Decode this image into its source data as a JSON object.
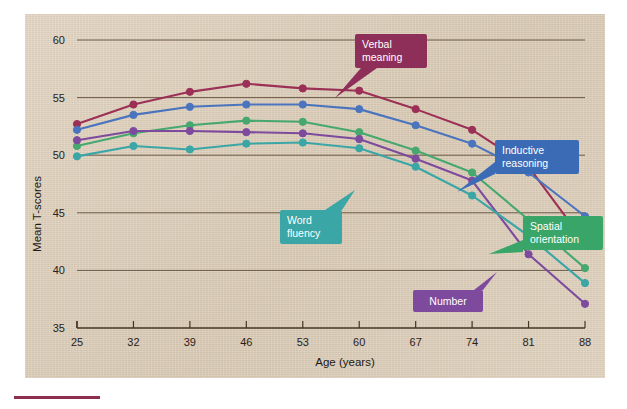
{
  "figure": {
    "background_color": "#ded0bd",
    "accent_rule_color": "#8e2f4f"
  },
  "axes": {
    "x_title": "Age (years)",
    "y_title": "Mean T-scores",
    "x_ticks": [
      "25",
      "32",
      "39",
      "46",
      "53",
      "60",
      "67",
      "74",
      "81",
      "88"
    ],
    "y_ticks": [
      "35",
      "40",
      "45",
      "50",
      "55",
      "60"
    ]
  },
  "callouts": [
    {
      "id": "verbal-meaning",
      "label": "Verbal meaning",
      "line1": "Verbal",
      "line2": "meaning",
      "color": "#8e2f5a"
    },
    {
      "id": "inductive-reasoning",
      "label": "Inductive reasoning",
      "line1": "Inductive",
      "line2": "reasoning",
      "color": "#3b6bb5"
    },
    {
      "id": "word-fluency",
      "label": "Word fluency",
      "line1": "Word",
      "line2": "fluency",
      "color": "#3aa6a6"
    },
    {
      "id": "spatial-orientation",
      "label": "Spatial orientation",
      "line1": "Spatial",
      "line2": "orientation",
      "color": "#3aa568"
    },
    {
      "id": "number",
      "label": "Number",
      "line1": "Number",
      "line2": "",
      "color": "#7d4a9e"
    }
  ],
  "chart_data": {
    "type": "line",
    "title": "",
    "xlabel": "Age (years)",
    "ylabel": "Mean T-scores",
    "x": [
      25,
      32,
      39,
      46,
      53,
      60,
      67,
      74,
      81,
      88
    ],
    "xlim": [
      25,
      88
    ],
    "ylim": [
      35,
      60
    ],
    "grid": true,
    "legend_position": "inline-callouts",
    "series": [
      {
        "name": "Verbal meaning",
        "color": "#9b2f55",
        "values": [
          52.7,
          54.4,
          55.5,
          56.2,
          55.8,
          55.6,
          54.0,
          52.2,
          49.0,
          42.4
        ]
      },
      {
        "name": "Inductive reasoning",
        "color": "#4a74bd",
        "values": [
          52.2,
          53.5,
          54.2,
          54.4,
          54.4,
          54.0,
          52.6,
          51.0,
          48.5,
          44.7
        ]
      },
      {
        "name": "Spatial orientation",
        "color": "#46a86e",
        "values": [
          50.8,
          51.9,
          52.6,
          53.0,
          52.9,
          52.0,
          50.4,
          48.5,
          44.4,
          40.2
        ]
      },
      {
        "name": "Number",
        "color": "#7d4a9e",
        "values": [
          51.3,
          52.1,
          52.1,
          52.0,
          51.9,
          51.4,
          49.7,
          47.8,
          41.4,
          37.1
        ]
      },
      {
        "name": "Word fluency",
        "color": "#3aa6a6",
        "values": [
          49.9,
          50.8,
          50.5,
          51.0,
          51.1,
          50.6,
          49.0,
          46.5,
          43.0,
          38.9
        ]
      }
    ]
  }
}
